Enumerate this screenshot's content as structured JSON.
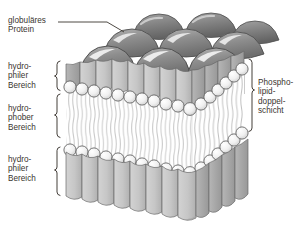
{
  "diagram": {
    "background_color": "#ffffff",
    "text_color": "#3a352f",
    "labels": {
      "protein": "globuläres\nProtein",
      "hydrophilic_top": "hydro-\nphiler\nBereich",
      "hydrophobic": "hydro-\nphober\nBereich",
      "hydrophilic_bottom": "hydro-\nphiler\nBereich",
      "bilayer": "Phospho-\nlipid-\ndoppel-\nschicht"
    },
    "colors": {
      "protein_dome": "#8d8d8d",
      "protein_dome_dark": "#6f6f6f",
      "protein_dome_light": "#b9b9b9",
      "protein_column": "#c7c7c7",
      "protein_column_shade": "#a8a8a8",
      "head_group": "#f2f2f2",
      "head_group_stroke": "#5a5a5a",
      "tail": "#c4c4c4",
      "outline": "#4a4a4a",
      "bracket": "#3a352f",
      "leader_line": "#3a352f"
    },
    "structure": {
      "layers": [
        "globular proteins (top surface domes)",
        "upper hydrophilic head groups",
        "hydrophobic fatty-acid tail core",
        "lower hydrophilic head groups",
        "globular proteins (lower columns)"
      ],
      "brackets_left": 3,
      "brackets_right": 1,
      "leader_lines": 1
    }
  }
}
